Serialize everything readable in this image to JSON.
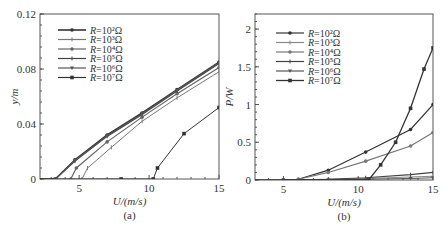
{
  "chart_data": [
    {
      "type": "line",
      "panel_label": "(a)",
      "title": "",
      "xlabel": "U/(m/s)",
      "ylabel": "y/m",
      "xlim": [
        2.2,
        15
      ],
      "ylim": [
        0,
        0.12
      ],
      "xticks": [
        5,
        10,
        15
      ],
      "yticks": [
        0,
        0.04,
        0.08,
        0.12
      ],
      "ytick_labels": [
        "0",
        "0.04",
        "0.08",
        "0.12"
      ],
      "grid": false,
      "legend_position": "upper left",
      "series": [
        {
          "name": "R=10²Ω",
          "color": "#333333",
          "width": 1.6,
          "marker": "circle",
          "x": [
            2.2,
            3.3,
            4.7,
            7.0,
            9.5,
            12.0,
            15.0
          ],
          "y": [
            0,
            0,
            0.014,
            0.032,
            0.048,
            0.065,
            0.085
          ]
        },
        {
          "name": "R=10³Ω",
          "color": "#777777",
          "width": 1.0,
          "marker": "plus",
          "x": [
            5.2,
            5.6,
            7.3,
            9.5,
            12.0,
            15.0
          ],
          "y": [
            0,
            0.008,
            0.023,
            0.042,
            0.059,
            0.078
          ]
        },
        {
          "name": "R=10⁴Ω",
          "color": "#666666",
          "width": 1.2,
          "marker": "circle",
          "x": [
            4.4,
            4.8,
            7.0,
            9.5,
            12.0,
            15.0
          ],
          "y": [
            0,
            0.008,
            0.027,
            0.045,
            0.062,
            0.081
          ]
        },
        {
          "name": "R=10⁵Ω",
          "color": "#444444",
          "width": 1.2,
          "marker": "plus",
          "x": [
            3.3,
            4.7,
            7.0,
            9.5,
            12.0,
            15.0
          ],
          "y": [
            0,
            0.013,
            0.031,
            0.047,
            0.064,
            0.084
          ]
        },
        {
          "name": "R=10⁶Ω",
          "color": "#555555",
          "width": 1.2,
          "marker": "triangle",
          "x": [
            3.3,
            4.7,
            7.0,
            9.5,
            12.0,
            15.0
          ],
          "y": [
            0,
            0.0135,
            0.0315,
            0.0475,
            0.0645,
            0.0845
          ]
        },
        {
          "name": "R=10⁷Ω",
          "color": "#333333",
          "width": 1.0,
          "marker": "square",
          "x": [
            2.2,
            8.0,
            10.3,
            10.6,
            12.5,
            15.0
          ],
          "y": [
            0,
            0,
            0,
            0.008,
            0.033,
            0.052
          ]
        }
      ]
    },
    {
      "type": "line",
      "panel_label": "(b)",
      "title": "",
      "xlabel": "U/(m/s)",
      "ylabel": "P/W",
      "xlim": [
        3.1,
        15
      ],
      "ylim": [
        0,
        2.2
      ],
      "xticks": [
        5,
        10,
        15
      ],
      "yticks": [
        0,
        0.5,
        1,
        1.5,
        2
      ],
      "ytick_labels": [
        "0",
        "0.5",
        "1",
        "1.5",
        "2"
      ],
      "grid": false,
      "legend_position": "upper left",
      "series": [
        {
          "name": "R=10²Ω",
          "color": "#333333",
          "width": 1.2,
          "marker": "circle",
          "x": [
            5.0,
            6.0,
            8.0,
            10.5,
            13.5,
            15.0
          ],
          "y": [
            0,
            0.01,
            0.13,
            0.37,
            0.67,
            1.0
          ]
        },
        {
          "name": "R=10³Ω",
          "color": "#888888",
          "width": 1.0,
          "marker": "plus",
          "x": [
            5.0,
            8.0,
            10.5,
            13.5,
            15.0
          ],
          "y": [
            0,
            0.01,
            0.02,
            0.04,
            0.05
          ]
        },
        {
          "name": "R=10⁴Ω",
          "color": "#777777",
          "width": 1.2,
          "marker": "circle",
          "x": [
            5.0,
            6.0,
            8.0,
            10.5,
            13.5,
            15.0
          ],
          "y": [
            0,
            0.01,
            0.1,
            0.25,
            0.45,
            0.63
          ]
        },
        {
          "name": "R=10⁵Ω",
          "color": "#444444",
          "width": 1.2,
          "marker": "plus",
          "x": [
            5.0,
            8.0,
            10.5,
            13.5,
            15.0
          ],
          "y": [
            0,
            0.01,
            0.03,
            0.07,
            0.1
          ]
        },
        {
          "name": "R=10⁶Ω",
          "color": "#555555",
          "width": 1.0,
          "marker": "triangle",
          "x": [
            5.0,
            8.0,
            10.5,
            13.5,
            15.0
          ],
          "y": [
            0,
            0.0,
            0.01,
            0.02,
            0.03
          ]
        },
        {
          "name": "R=10⁷Ω",
          "color": "#333333",
          "width": 1.3,
          "marker": "square",
          "x": [
            3.1,
            10.7,
            11.5,
            12.5,
            13.5,
            14.4,
            15.0
          ],
          "y": [
            0,
            0,
            0.2,
            0.5,
            0.95,
            1.47,
            1.75
          ]
        }
      ]
    }
  ],
  "panels": [
    {
      "label": "(a)",
      "xlabel": "U/(m/s)",
      "ylabel": "y/m"
    },
    {
      "label": "(b)",
      "xlabel": "U/(m/s)",
      "ylabel": "P/W"
    }
  ]
}
